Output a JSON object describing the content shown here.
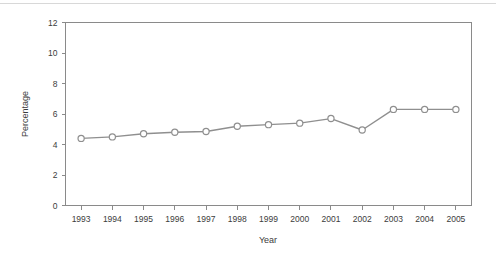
{
  "chart_data": {
    "type": "line",
    "title": "",
    "xlabel": "Year",
    "ylabel": "Percentage",
    "categories": [
      "1993",
      "1994",
      "1995",
      "1996",
      "1997",
      "1998",
      "1999",
      "2000",
      "2001",
      "2002",
      "2003",
      "2004",
      "2005"
    ],
    "values": [
      4.4,
      4.5,
      4.7,
      4.8,
      4.85,
      5.2,
      5.3,
      5.4,
      5.7,
      4.95,
      6.3,
      6.3,
      6.3
    ],
    "series": [
      {
        "name": "Percentage",
        "values": [
          4.4,
          4.5,
          4.7,
          4.8,
          4.85,
          5.2,
          5.3,
          5.4,
          5.7,
          4.95,
          6.3,
          6.3,
          6.3
        ]
      }
    ],
    "ylim": [
      0,
      12
    ],
    "yticks": [
      0,
      2,
      4,
      6,
      8,
      10,
      12
    ],
    "ytick_labels": [
      "0",
      "2",
      "4",
      "6",
      "8",
      "10",
      "12"
    ],
    "xtick_labels": [
      "1993",
      "1994",
      "1995",
      "1996",
      "1997",
      "1998",
      "1999",
      "2000",
      "2001",
      "2002",
      "2003",
      "2004",
      "2005"
    ],
    "grid": false,
    "legend": null,
    "marker": "open-circle",
    "line_color": "#8f8f8f",
    "marker_fill": "#ffffff",
    "axis_color": "#8a8a8a",
    "background": "#ffffff"
  }
}
